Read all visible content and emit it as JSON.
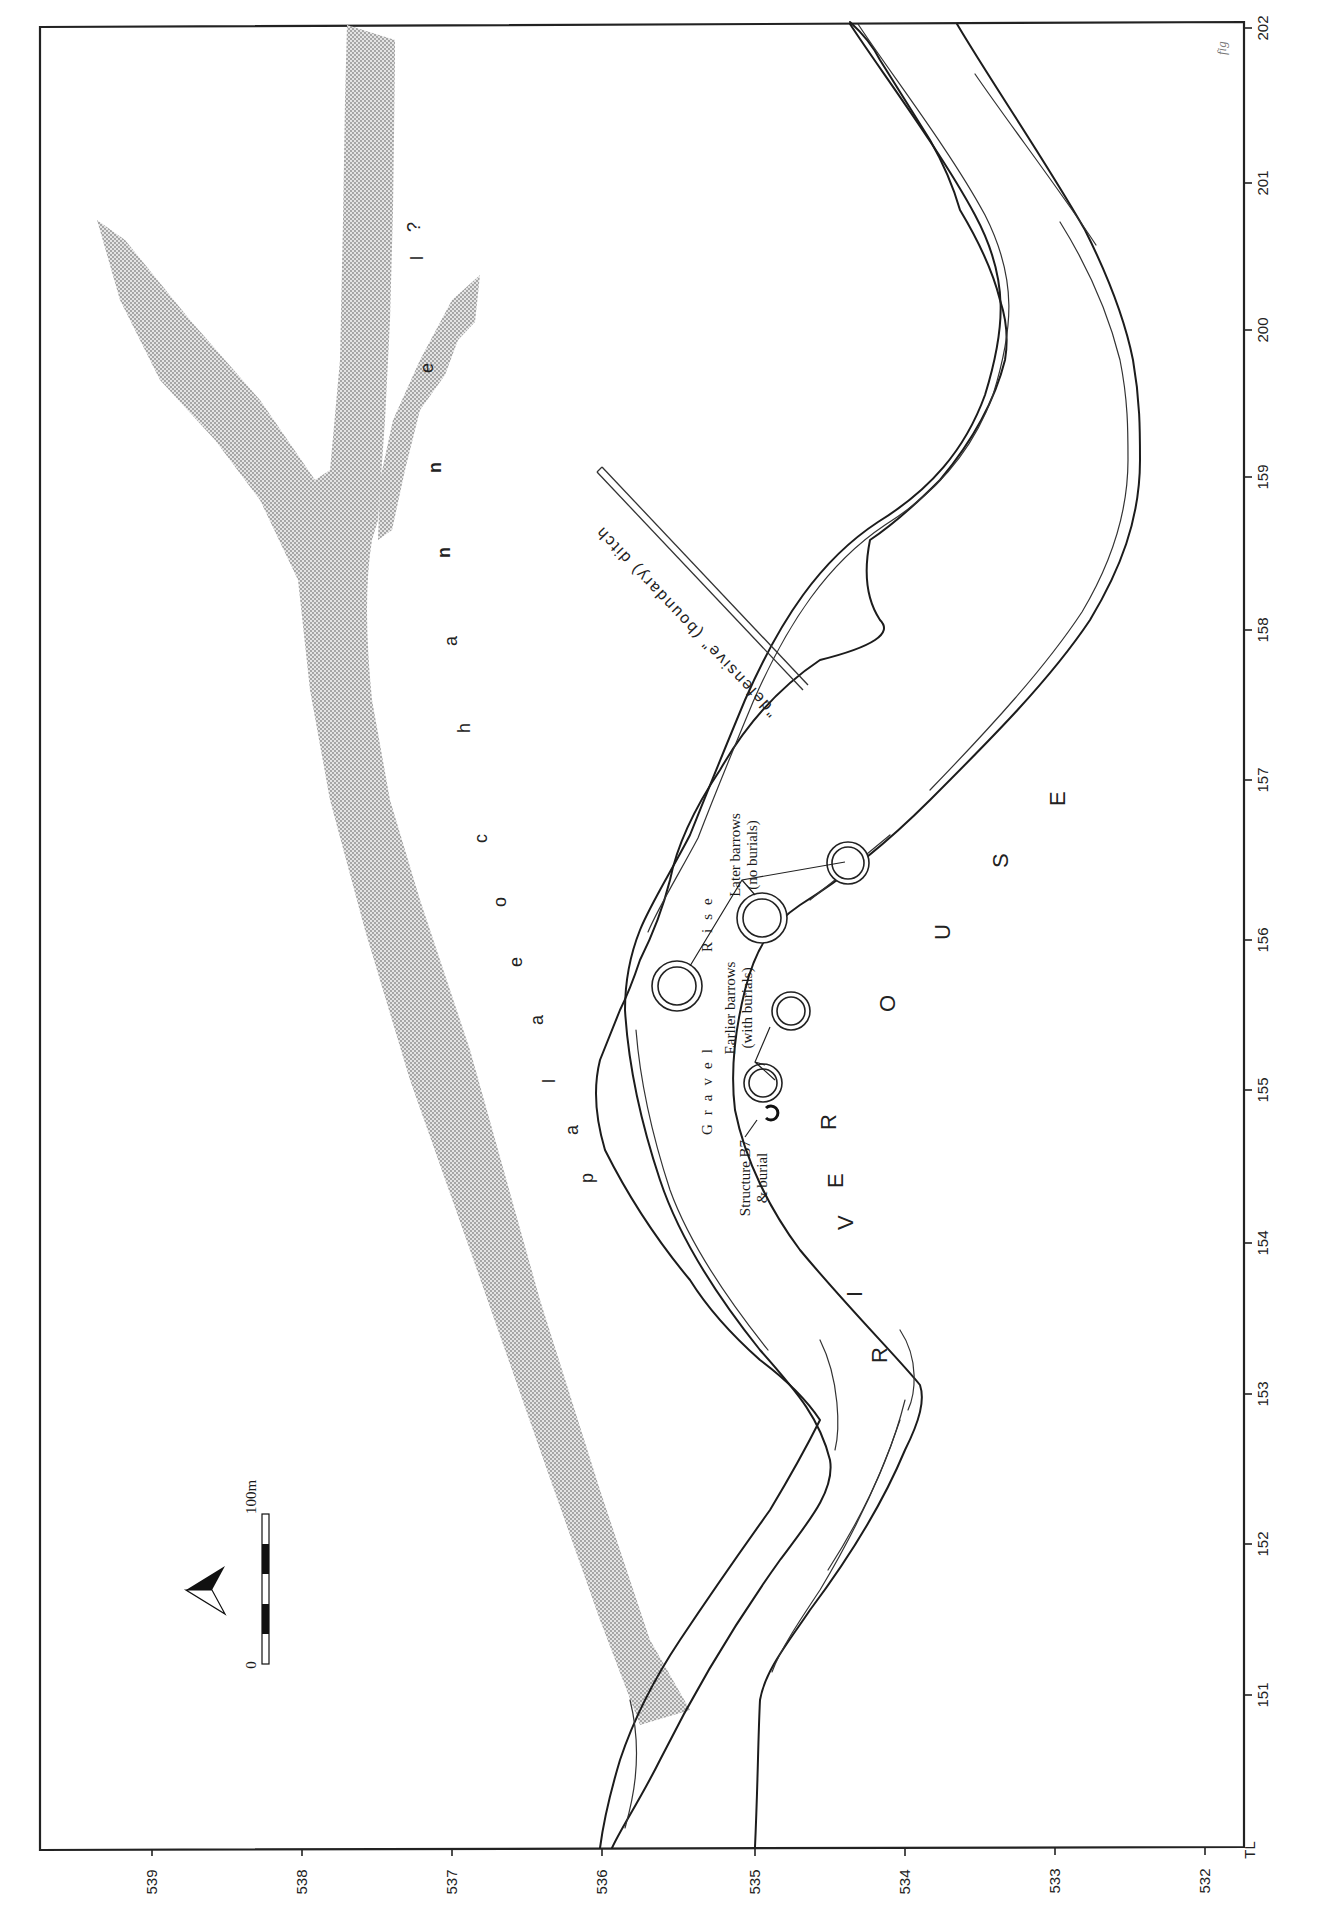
{
  "figure": {
    "orientation": "rotated 90° (landscape map printed on portrait page)",
    "sheet_mark": "fig",
    "grid_corner_label": "TL"
  },
  "axes": {
    "bottom_ticks": [
      {
        "label": "539",
        "x": 152
      },
      {
        "label": "538",
        "x": 302
      },
      {
        "label": "537",
        "x": 452
      },
      {
        "label": "536",
        "x": 602
      },
      {
        "label": "535",
        "x": 755
      },
      {
        "label": "534",
        "x": 905
      },
      {
        "label": "533",
        "x": 1055
      },
      {
        "label": "532",
        "x": 1205
      }
    ],
    "right_ticks": [
      {
        "label": "202",
        "y": 28
      },
      {
        "label": "201",
        "y": 183
      },
      {
        "label": "200",
        "y": 330
      },
      {
        "label": "159",
        "y": 477
      },
      {
        "label": "158",
        "y": 630
      },
      {
        "label": "157",
        "y": 780
      },
      {
        "label": "156",
        "y": 940
      },
      {
        "label": "155",
        "y": 1090
      },
      {
        "label": "154",
        "y": 1243
      },
      {
        "label": "153",
        "y": 1394
      },
      {
        "label": "152",
        "y": 1544
      },
      {
        "label": "151",
        "y": 1695
      }
    ]
  },
  "features": {
    "palaeochannel": {
      "letters": [
        "p",
        "a",
        "l",
        "a",
        "e",
        "o",
        "c",
        "h",
        "a",
        "n",
        "n",
        "e",
        "l",
        "?"
      ],
      "fill": "#bdbdbd"
    },
    "river": {
      "letters": [
        "R",
        "I",
        "V",
        "E",
        "R",
        "O",
        "U",
        "S",
        "E"
      ]
    },
    "ditch_label": "\"defensive\" (boundary) ditch",
    "gravel_rise": {
      "word1": "Gravel",
      "word2": "Rise"
    },
    "later_barrows": {
      "line1": "Later barrows",
      "line2": "(no burials)"
    },
    "earlier_barrows": {
      "line1": "Earlier barrows",
      "line2": "(with burials)"
    },
    "structure_b7": {
      "line1": "Structure B7",
      "line2": "& burial"
    }
  },
  "legend": {
    "scale_bar": {
      "start_label": "0",
      "end_label": "100m",
      "segments": 5
    },
    "north_arrow": "north-arrow pointing left"
  }
}
